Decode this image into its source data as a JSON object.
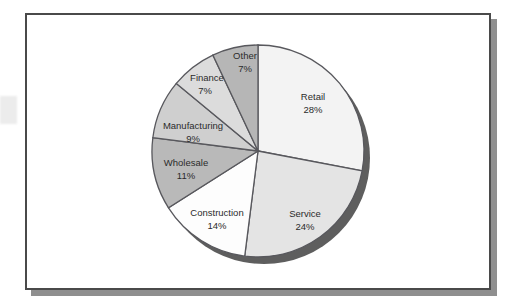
{
  "figure": {
    "frame": {
      "border_color": "#4a4a4a",
      "shadow_color": "#8f8f8f",
      "background": "#ffffff"
    }
  },
  "chart_data": {
    "type": "pie",
    "title": "",
    "subtitle": "",
    "xlabel": "",
    "ylabel": "",
    "grid": false,
    "legend": "none",
    "labels_inside_slices": true,
    "label_format": "name + percent",
    "start_angle_deg": 0,
    "direction": "clockwise",
    "three_d_shadow": true,
    "shadow_color": "#5e5e5e",
    "outline_color": "#58585d",
    "categories": [
      "Retail",
      "Service",
      "Construction",
      "Wholesale",
      "Manufacturing",
      "Finance",
      "Other"
    ],
    "values": [
      28,
      24,
      14,
      11,
      9,
      7,
      7
    ],
    "units": "percent",
    "total": 100,
    "slices": [
      {
        "label": "Retail",
        "value": 28,
        "value_text": "28%",
        "color": "#f3f3f3",
        "label_x": 311,
        "label_y": 95,
        "pct_x": 311,
        "pct_y": 108
      },
      {
        "label": "Service",
        "value": 24,
        "value_text": "24%",
        "color": "#e4e4e4",
        "label_x": 303,
        "label_y": 212,
        "pct_x": 303,
        "pct_y": 225
      },
      {
        "label": "Construction",
        "value": 14,
        "value_text": "14%",
        "color": "#fdfdfd",
        "label_x": 215,
        "label_y": 211,
        "pct_x": 215,
        "pct_y": 224
      },
      {
        "label": "Wholesale",
        "value": 11,
        "value_text": "11%",
        "color": "#b9b9b9",
        "label_x": 184,
        "label_y": 161,
        "pct_x": 184,
        "pct_y": 174
      },
      {
        "label": "Manufacturing",
        "value": 9,
        "value_text": "9%",
        "color": "#cfcfcf",
        "label_x": 191,
        "label_y": 124,
        "pct_x": 191,
        "pct_y": 137
      },
      {
        "label": "Finance",
        "value": 7,
        "value_text": "7%",
        "color": "#dcdcdc",
        "label_x": 205,
        "label_y": 76,
        "pct_x": 203,
        "pct_y": 89
      },
      {
        "label": "Other",
        "value": 7,
        "value_text": "7%",
        "color": "#b6b6b6",
        "label_x": 243,
        "label_y": 54,
        "pct_x": 243,
        "pct_y": 67
      }
    ]
  }
}
